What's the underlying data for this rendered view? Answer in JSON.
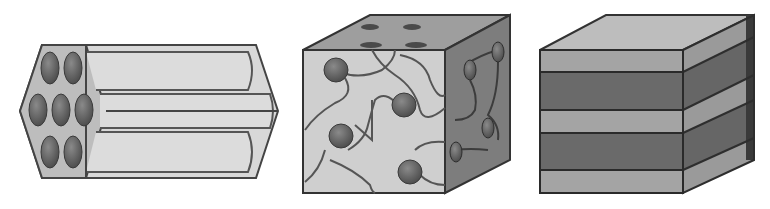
{
  "figure": {
    "panels": [
      {
        "id": "hexagonal",
        "description": "Hexagonally packed cylinders (rod bundle)",
        "rods": 7
      },
      {
        "id": "bicontinuous",
        "description": "Bicontinuous cubic phase with channel network",
        "spheres_front": 5,
        "spheres_side": 5
      },
      {
        "id": "lamellar",
        "description": "Lamellar stacked layers in a cube",
        "layers": 5
      }
    ],
    "colors": {
      "outline": "#3a3a3a",
      "light_fill": "#d4d4d4",
      "mid_fill": "#a8a8a8",
      "dark_fill": "#666666",
      "side_fill": "#888888",
      "sphere": "#6e6e6e"
    }
  }
}
